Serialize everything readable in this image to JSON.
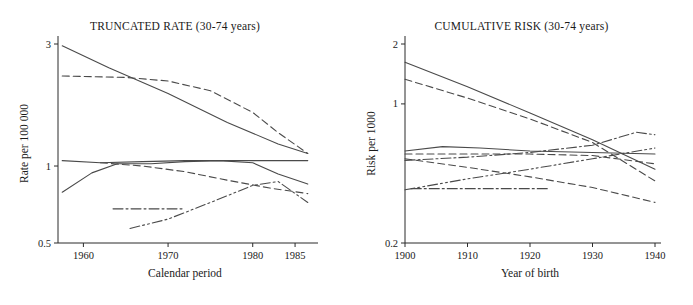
{
  "chart_data": [
    {
      "type": "line",
      "panel": "left",
      "title": "TRUNCATED RATE (30-74 years)",
      "xlabel": "Calendar period",
      "ylabel": "Rate per 100 000",
      "yscale": "log",
      "ylim": [
        0.5,
        3
      ],
      "ytick_values": [
        0.5,
        1,
        3
      ],
      "ytick_labels": [
        "0.5",
        "1",
        "3"
      ],
      "xlim": [
        1957,
        1987
      ],
      "xtick_values": [
        1960,
        1970,
        1980,
        1985
      ],
      "xtick_labels": [
        "1960",
        "1970",
        "1980",
        "1985"
      ],
      "grid": false,
      "legend": "none",
      "series": [
        {
          "name": "series-1-solid-steep-decline",
          "style": "solid",
          "x": [
            1957.5,
            1963,
            1970,
            1977,
            1983,
            1986.5
          ],
          "y": [
            2.95,
            2.42,
            1.92,
            1.48,
            1.22,
            1.12
          ]
        },
        {
          "name": "series-2-dashed-high-plateau",
          "style": "dashed",
          "x": [
            1957.5,
            1965,
            1970,
            1975,
            1980,
            1983,
            1986.5
          ],
          "y": [
            2.25,
            2.22,
            2.15,
            1.97,
            1.62,
            1.35,
            1.12
          ]
        },
        {
          "name": "series-3-solid-flat",
          "style": "solid",
          "x": [
            1957.5,
            1962,
            1967,
            1972,
            1977,
            1982,
            1986.5
          ],
          "y": [
            1.05,
            1.03,
            1.04,
            1.05,
            1.05,
            1.05,
            1.05
          ]
        },
        {
          "name": "series-4-solid-rise-fall",
          "style": "solid",
          "x": [
            1957.5,
            1961,
            1964,
            1968,
            1972,
            1976,
            1980,
            1983,
            1986.5
          ],
          "y": [
            0.79,
            0.94,
            1.02,
            1.02,
            1.04,
            1.05,
            1.03,
            0.93,
            0.85
          ]
        },
        {
          "name": "series-5-dashed-decline",
          "style": "dashed",
          "x": [
            1962,
            1967,
            1972,
            1977,
            1982,
            1986.5
          ],
          "y": [
            1.03,
            1.0,
            0.95,
            0.88,
            0.82,
            0.78
          ]
        },
        {
          "name": "series-6-dashdot-flat-short",
          "style": "dashdot",
          "x": [
            1963.5,
            1968,
            1972
          ],
          "y": [
            0.68,
            0.68,
            0.68
          ]
        },
        {
          "name": "series-7-dashdotdot-rising",
          "style": "dashdotdot",
          "x": [
            1965.5,
            1970,
            1975,
            1980,
            1983,
            1986.5
          ],
          "y": [
            0.57,
            0.62,
            0.72,
            0.84,
            0.87,
            0.72
          ]
        }
      ]
    },
    {
      "type": "line",
      "panel": "right",
      "title": "CUMULATIVE RISK (30-74 years)",
      "xlabel": "Year of birth",
      "ylabel": "Risk per 1000",
      "yscale": "log",
      "ylim": [
        0.2,
        2
      ],
      "ytick_values": [
        0.2,
        1,
        2
      ],
      "ytick_labels": [
        "0.2",
        "1",
        "2"
      ],
      "xlim": [
        1900,
        1940
      ],
      "xtick_values": [
        1900,
        1910,
        1920,
        1930,
        1940
      ],
      "xtick_labels": [
        "1900",
        "1910",
        "1920",
        "1930",
        "1940"
      ],
      "grid": false,
      "legend": "none",
      "series": [
        {
          "name": "series-1-solid-steep-decline",
          "style": "solid",
          "x": [
            1900,
            1910,
            1920,
            1930,
            1940
          ],
          "y": [
            1.62,
            1.22,
            0.9,
            0.66,
            0.47
          ]
        },
        {
          "name": "series-2-dashed-decline",
          "style": "dashed",
          "x": [
            1900,
            1910,
            1920,
            1930,
            1940
          ],
          "y": [
            1.33,
            1.07,
            0.84,
            0.64,
            0.41
          ]
        },
        {
          "name": "series-3-solid-flat-high",
          "style": "solid",
          "x": [
            1900,
            1906,
            1912,
            1920,
            1930,
            1940
          ],
          "y": [
            0.58,
            0.61,
            0.6,
            0.58,
            0.57,
            0.56
          ]
        },
        {
          "name": "series-4-dashed-flat",
          "style": "dashed",
          "x": [
            1900,
            1910,
            1920,
            1930,
            1940
          ],
          "y": [
            0.56,
            0.56,
            0.56,
            0.55,
            0.5
          ]
        },
        {
          "name": "series-5-dashdot-rising",
          "style": "dashdot",
          "x": [
            1900,
            1910,
            1920,
            1930,
            1937,
            1940
          ],
          "y": [
            0.52,
            0.54,
            0.57,
            0.62,
            0.72,
            0.7
          ]
        },
        {
          "name": "series-6-dashed-declining-lower",
          "style": "dashed",
          "x": [
            1900,
            1910,
            1920,
            1930,
            1940
          ],
          "y": [
            0.53,
            0.48,
            0.43,
            0.38,
            0.32
          ]
        },
        {
          "name": "series-7-dashdotdot-rising-low",
          "style": "dashdotdot",
          "x": [
            1900,
            1910,
            1920,
            1930,
            1940
          ],
          "y": [
            0.37,
            0.42,
            0.47,
            0.53,
            0.6
          ]
        },
        {
          "name": "series-8-dashdot-flat-short",
          "style": "dashdot",
          "x": [
            1901,
            1912,
            1923
          ],
          "y": [
            0.375,
            0.375,
            0.375
          ]
        }
      ]
    }
  ]
}
